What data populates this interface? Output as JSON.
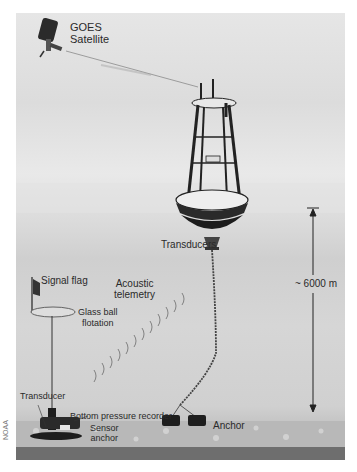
{
  "diagram": {
    "title_labels": {
      "satellite": [
        "GOES",
        "Satellite"
      ],
      "transducers": "Transducers",
      "signal_flag": "Signal flag",
      "acoustic": [
        "Acoustic",
        "telemetry"
      ],
      "glass_ball": [
        "Glass ball",
        "flotation"
      ],
      "depth": "~ 6000 m",
      "transducer": "Transducer",
      "bpr": "Bottom pressure recorder",
      "sensor_anchor": [
        "Sensor",
        "anchor"
      ],
      "anchor": "Anchor"
    },
    "credit": "NOAA"
  }
}
